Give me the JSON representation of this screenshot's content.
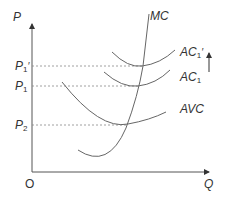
{
  "diagram": {
    "axes": {
      "y_label": "P",
      "x_label": "Q",
      "origin_label": "O"
    },
    "price_levels": [
      {
        "label": "P",
        "sub": "1",
        "prime": "′",
        "y": 66
      },
      {
        "label": "P",
        "sub": "1",
        "prime": "",
        "y": 86
      },
      {
        "label": "P",
        "sub": "2",
        "prime": "",
        "y": 125
      }
    ],
    "curves": [
      {
        "name": "MC",
        "label": "MC"
      },
      {
        "name": "AC1prime",
        "label": "AC",
        "sub": "1",
        "prime": "′"
      },
      {
        "name": "AC1",
        "label": "AC",
        "sub": "1"
      },
      {
        "name": "AVC",
        "label": "AVC"
      }
    ],
    "annotation": "upward-arrow indicating shift from AC1 to AC1′",
    "colors": {
      "line": "#555555",
      "dashed": "#888888",
      "text": "#333333"
    }
  }
}
